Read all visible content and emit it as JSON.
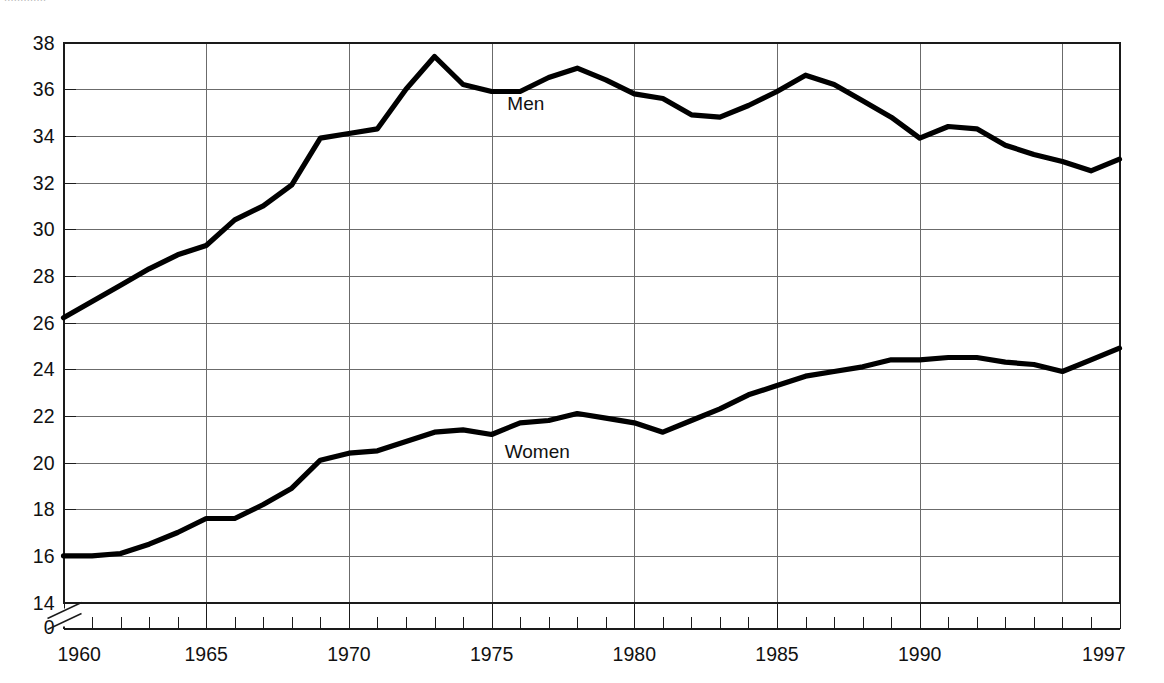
{
  "header": {
    "clipped_text": "............."
  },
  "chart_data": {
    "type": "line",
    "title": "",
    "xlabel": "",
    "ylabel": "",
    "x": [
      1960,
      1961,
      1962,
      1963,
      1964,
      1965,
      1966,
      1967,
      1968,
      1969,
      1970,
      1971,
      1972,
      1973,
      1974,
      1975,
      1976,
      1977,
      1978,
      1979,
      1980,
      1981,
      1982,
      1983,
      1984,
      1985,
      1986,
      1987,
      1988,
      1989,
      1990,
      1991,
      1992,
      1993,
      1994,
      1995,
      1996,
      1997
    ],
    "xlim": [
      1960,
      1997
    ],
    "ylim": [
      14,
      38
    ],
    "y_ticks": [
      14,
      16,
      18,
      20,
      22,
      24,
      26,
      28,
      30,
      32,
      34,
      36,
      38
    ],
    "y_tick_labels": [
      "14",
      "16",
      "18",
      "20",
      "22",
      "24",
      "26",
      "28",
      "30",
      "32",
      "34",
      "36",
      "38"
    ],
    "y_zero_label": "0",
    "axis_break": true,
    "x_major_ticks": [
      1960,
      1965,
      1970,
      1975,
      1980,
      1985,
      1990,
      1997
    ],
    "x_major_labels": [
      "1960",
      "1965",
      "1970",
      "1975",
      "1980",
      "1985",
      "1990",
      "1997"
    ],
    "x_gridlines": [
      1965,
      1970,
      1975,
      1980,
      1985,
      1990,
      1995
    ],
    "y_gridlines": [
      16,
      18,
      20,
      22,
      24,
      26,
      28,
      30,
      32,
      34,
      36
    ],
    "grid": true,
    "legend_position": "inline-annotations",
    "series": [
      {
        "name": "Men",
        "label": "Men",
        "label_x": 1976.2,
        "label_y": 35.1,
        "color": "#000000",
        "values": [
          26.2,
          26.9,
          27.6,
          28.3,
          28.9,
          29.3,
          30.4,
          31.0,
          31.9,
          33.9,
          34.1,
          34.3,
          36.0,
          37.4,
          36.2,
          35.9,
          35.9,
          36.5,
          36.9,
          36.4,
          35.8,
          35.6,
          34.9,
          34.8,
          35.3,
          35.9,
          36.6,
          36.2,
          35.5,
          34.8,
          33.9,
          34.4,
          34.3,
          33.6,
          33.2,
          32.9,
          32.5,
          33.0
        ]
      },
      {
        "name": "Women",
        "label": "Women",
        "label_x": 1976.6,
        "label_y": 20.2,
        "color": "#000000",
        "values": [
          16.0,
          16.0,
          16.1,
          16.5,
          17.0,
          17.6,
          17.6,
          18.2,
          18.9,
          20.1,
          20.4,
          20.5,
          20.9,
          21.3,
          21.4,
          21.2,
          21.7,
          21.8,
          22.1,
          21.9,
          21.7,
          21.3,
          21.8,
          22.3,
          22.9,
          23.3,
          23.7,
          23.9,
          24.1,
          24.4,
          24.4,
          24.5,
          24.5,
          24.3,
          24.2,
          23.9,
          24.4,
          24.9
        ]
      }
    ]
  }
}
